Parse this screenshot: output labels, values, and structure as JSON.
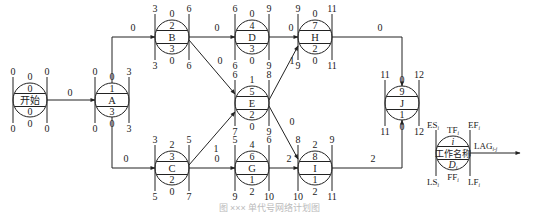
{
  "diagram": {
    "type": "single-code network (precedence) diagram with time parameters",
    "caption": "图 ××× 单代号网络计划图",
    "nodes": [
      {
        "id": "start",
        "code": "0",
        "name": "开始",
        "duration": "0",
        "ES": "0",
        "EF": "0",
        "LS": "0",
        "LF": "0",
        "TF": "0",
        "FF": "0",
        "cx": 30,
        "cy": 100
      },
      {
        "id": "A",
        "code": "1",
        "name": "A",
        "duration": "3",
        "ES": "0",
        "EF": "3",
        "LS": "0",
        "LF": "3",
        "TF": "0",
        "FF": "0",
        "cx": 112,
        "cy": 100
      },
      {
        "id": "B",
        "code": "2",
        "name": "B",
        "duration": "3",
        "ES": "3",
        "EF": "6",
        "LS": "3",
        "LF": "6",
        "TF": "0",
        "FF": "0",
        "cx": 172,
        "cy": 37
      },
      {
        "id": "C",
        "code": "3",
        "name": "C",
        "duration": "2",
        "ES": "3",
        "EF": "5",
        "LS": "5",
        "LF": "7",
        "TF": "2",
        "FF": "0",
        "cx": 172,
        "cy": 168
      },
      {
        "id": "D",
        "code": "4",
        "name": "D",
        "duration": "3",
        "ES": "6",
        "EF": "9",
        "LS": "6",
        "LF": "9",
        "TF": "0",
        "FF": "0",
        "cx": 252,
        "cy": 37
      },
      {
        "id": "E",
        "code": "5",
        "name": "E",
        "duration": "2",
        "ES": "6",
        "EF": "8",
        "LS": "7",
        "LF": "9",
        "TF": "1",
        "FF": "0",
        "cx": 252,
        "cy": 103
      },
      {
        "id": "G",
        "code": "6",
        "name": "G",
        "duration": "1",
        "ES": "5",
        "EF": "6",
        "LS": "9",
        "LF": "10",
        "TF": "4",
        "FF": "2",
        "cx": 252,
        "cy": 168
      },
      {
        "id": "H",
        "code": "7",
        "name": "H",
        "duration": "2",
        "ES": "9",
        "EF": "11",
        "LS": "9",
        "LF": "11",
        "TF": "0",
        "FF": "0",
        "cx": 315,
        "cy": 37
      },
      {
        "id": "I",
        "code": "8",
        "name": "I",
        "duration": "1",
        "ES": "8",
        "EF": "9",
        "LS": "10",
        "LF": "11",
        "TF": "2",
        "FF": "2",
        "cx": 315,
        "cy": 168
      },
      {
        "id": "J",
        "code": "9",
        "name": "J",
        "duration": "1",
        "ES": "11",
        "EF": "12",
        "LS": "11",
        "LF": "12",
        "TF": "0",
        "FF": "0",
        "cx": 402,
        "cy": 103
      }
    ],
    "edges": [
      {
        "from": "start",
        "to": "A",
        "lag": "0",
        "label_x": 70,
        "label_y": 96
      },
      {
        "from": "A",
        "to": "B",
        "lag": "0",
        "label_x": 133,
        "label_y": 31
      },
      {
        "from": "A",
        "to": "C",
        "lag": "0",
        "label_x": 126,
        "label_y": 162
      },
      {
        "from": "B",
        "to": "D",
        "lag": "0",
        "label_x": 217,
        "label_y": 31
      },
      {
        "from": "B",
        "to": "E",
        "lag": "0",
        "label_x": 220,
        "label_y": 64
      },
      {
        "from": "C",
        "to": "E",
        "lag": "1",
        "label_x": 216,
        "label_y": 152
      },
      {
        "from": "C",
        "to": "G",
        "lag": "0",
        "label_x": 217,
        "label_y": 162
      },
      {
        "from": "D",
        "to": "H",
        "lag": "0",
        "label_x": 291,
        "label_y": 31
      },
      {
        "from": "E",
        "to": "H",
        "lag": "1",
        "label_x": 292,
        "label_y": 64
      },
      {
        "from": "E",
        "to": "I",
        "lag": "0",
        "label_x": 292,
        "label_y": 125
      },
      {
        "from": "G",
        "to": "I",
        "lag": "2",
        "label_x": 289,
        "label_y": 162
      },
      {
        "from": "H",
        "to": "J",
        "lag": "0",
        "label_x": 380,
        "label_y": 31
      },
      {
        "from": "I",
        "to": "J",
        "lag": "2",
        "label_x": 373,
        "label_y": 162
      }
    ],
    "legend": {
      "ES": "ES",
      "ES_sub": "i",
      "TF": "TF",
      "TF_sub": "i",
      "EF": "EF",
      "EF_sub": "i",
      "code": "i",
      "name": "工作名称",
      "duration": "D",
      "duration_sub": "i",
      "LS": "LS",
      "LS_sub": "i",
      "FF": "FF",
      "FF_sub": "i",
      "LF": "LF",
      "LF_sub": "i",
      "lag": "LAG",
      "lag_sub": "i-j"
    },
    "colors": {
      "line": "#222222",
      "background": "#ffffff"
    }
  }
}
